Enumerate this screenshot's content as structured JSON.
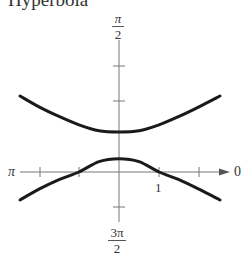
{
  "chart_data": {
    "type": "line",
    "title": "Hyperbola",
    "coordinate_system": "polar",
    "equation": "r = 1/(1 + 2 sin θ)",
    "axis_labels": {
      "top": {
        "num": "π",
        "den": "2"
      },
      "bottom": {
        "num": "3π",
        "den": "2"
      },
      "left": "π",
      "right": "0"
    },
    "tick_labels": [
      {
        "x": 1,
        "y": 0,
        "label": "1"
      }
    ],
    "x_ticks": [
      -2,
      -1,
      1,
      2
    ],
    "y_ticks": [
      1,
      -1
    ],
    "xlim": [
      -2.5,
      2.8
    ],
    "ylim": [
      -1.25,
      3.2
    ],
    "grid": false,
    "vertices": [
      [
        0,
        0.3333
      ],
      [
        0,
        1
      ]
    ],
    "axis_crossings": [
      [
        -1,
        0
      ],
      [
        1,
        0
      ]
    ],
    "series": [
      {
        "name": "upper branch",
        "x": [
          -2.475,
          -2,
          -1.5,
          -1,
          -0.5,
          0,
          0.5,
          1,
          1.5,
          2,
          2.525
        ],
        "y": [
          1.9,
          1.63,
          1.39,
          1.18,
          1.03,
          1.0,
          1.03,
          1.18,
          1.39,
          1.63,
          1.9
        ]
      },
      {
        "name": "lower branch",
        "x": [
          -2.475,
          -2,
          -1.5,
          -1,
          -0.5,
          0,
          0.5,
          1,
          1.5,
          2,
          2.525
        ],
        "y": [
          -0.7,
          -0.43,
          -0.19,
          0.0,
          0.26,
          0.333,
          0.26,
          0.0,
          -0.19,
          -0.43,
          -0.7
        ]
      }
    ]
  }
}
